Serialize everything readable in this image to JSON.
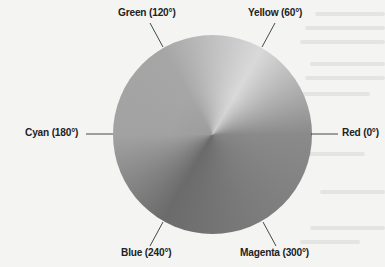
{
  "figure": {
    "hues": [
      {
        "name": "Red",
        "degrees": 0,
        "label": "Red (0°)",
        "gray": "#8a8a8a"
      },
      {
        "name": "Yellow",
        "degrees": 60,
        "label": "Yellow (60°)",
        "gray": "#d9d9d9"
      },
      {
        "name": "Green",
        "degrees": 120,
        "label": "Green (120°)",
        "gray": "#a6a6a6"
      },
      {
        "name": "Cyan",
        "degrees": 180,
        "label": "Cyan (180°)",
        "gray": "#a2a2a2"
      },
      {
        "name": "Blue",
        "degrees": 240,
        "label": "Blue (240°)",
        "gray": "#6b6b6b"
      },
      {
        "name": "Magenta",
        "degrees": 300,
        "label": "Magenta (300°)",
        "gray": "#7c7c7c"
      }
    ],
    "leader_line_color": "#333333",
    "text_color": "#222222"
  }
}
